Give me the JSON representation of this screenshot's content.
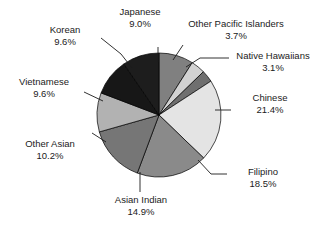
{
  "chart_data": {
    "type": "pie",
    "title": "",
    "subtitle": "",
    "xlabel": "",
    "ylabel": "",
    "legend_position": "none",
    "labels_outside": true,
    "leader_lines": true,
    "start_angle_deg": 0,
    "direction": "clockwise",
    "categories": [
      "Japanese",
      "Other Pacific Islanders",
      "Native Hawaiians",
      "Chinese",
      "Filipino",
      "Asian Indian",
      "Other Asian",
      "Vietnamese",
      "Korean"
    ],
    "values": [
      9.0,
      3.7,
      3.1,
      21.4,
      18.5,
      14.9,
      10.2,
      9.6,
      9.6
    ],
    "value_labels": [
      "9.0%",
      "3.7%",
      "3.1%",
      "21.4%",
      "18.5%",
      "14.9%",
      "10.2%",
      "9.6%",
      "9.6%"
    ],
    "unit": "%",
    "total": 100.0,
    "slice_colors": [
      "#808080",
      "#d2d2d2",
      "#6f6f6f",
      "#e4e4e4",
      "#8a8a8a",
      "#767676",
      "#b2b2b2",
      "#171717",
      "#1d1d1d"
    ],
    "slice_edge_color": "#000000"
  },
  "slices": [
    {
      "name": "Japanese",
      "pct": "9.0%",
      "color": "#808080"
    },
    {
      "name": "Other Pacific Islanders",
      "pct": "3.7%",
      "color": "#d2d2d2"
    },
    {
      "name": "Native Hawaiians",
      "pct": "3.1%",
      "color": "#6f6f6f"
    },
    {
      "name": "Chinese",
      "pct": "21.4%",
      "color": "#e4e4e4"
    },
    {
      "name": "Filipino",
      "pct": "18.5%",
      "color": "#8a8a8a"
    },
    {
      "name": "Asian Indian",
      "pct": "14.9%",
      "color": "#767676"
    },
    {
      "name": "Other Asian",
      "pct": "10.2%",
      "color": "#b2b2b2"
    },
    {
      "name": "Vietnamese",
      "pct": "9.6%",
      "color": "#171717"
    },
    {
      "name": "Korean",
      "pct": "9.6%",
      "color": "#1d1d1d"
    }
  ]
}
